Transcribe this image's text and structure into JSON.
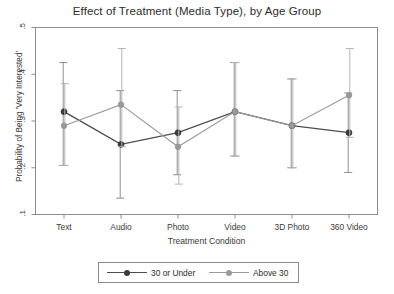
{
  "chart_data": {
    "type": "line",
    "title": "Effect of Treatment (Media Type), by Age Group",
    "xlabel": "Treatment Condition",
    "ylabel": "Probability of Being 'Very Interested'",
    "categories": [
      "Text",
      "Audio",
      "Photo",
      "Video",
      "3D Photo",
      "360 Video"
    ],
    "ylim": [
      0.1,
      0.5
    ],
    "yticks": [
      0.1,
      0.2,
      0.3,
      0.4,
      0.5
    ],
    "ytick_labels": [
      ".1",
      ".2",
      ".3",
      ".4",
      ".5"
    ],
    "grid": false,
    "legend_position": "below-plot",
    "error_bars": "95% confidence interval",
    "series": [
      {
        "name": "30 or Under",
        "color": "#4d4d4d",
        "marker": "filled-circle",
        "values": [
          0.32,
          0.25,
          0.275,
          0.32,
          0.29,
          0.275
        ],
        "ci_low": [
          0.205,
          0.135,
          0.185,
          0.225,
          0.2,
          0.19
        ],
        "ci_high": [
          0.425,
          0.365,
          0.365,
          0.425,
          0.39,
          0.36
        ]
      },
      {
        "name": "Above 30",
        "color": "#9a9a9a",
        "marker": "filled-circle-light",
        "values": [
          0.29,
          0.335,
          0.245,
          0.32,
          0.29,
          0.355
        ],
        "ci_low": [
          0.205,
          0.245,
          0.165,
          0.225,
          0.2,
          0.265
        ],
        "ci_high": [
          0.38,
          0.455,
          0.33,
          0.425,
          0.39,
          0.455
        ]
      }
    ]
  },
  "legend": {
    "items": [
      {
        "label": "30 or Under"
      },
      {
        "label": "Above 30"
      }
    ]
  }
}
